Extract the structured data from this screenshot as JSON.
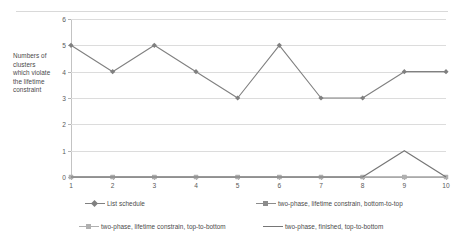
{
  "chart_data": {
    "type": "line",
    "title": "",
    "subtitle": "",
    "xlabel": "",
    "ylabel": "Numbers of clusters which violate the lifetime constraint",
    "ylabel_lines": [
      "Numbers of",
      "clusters",
      "which violate",
      "the lifetime",
      "constraint"
    ],
    "categories": [
      "1",
      "2",
      "3",
      "4",
      "5",
      "6",
      "7",
      "8",
      "9",
      "10"
    ],
    "x": [
      1,
      2,
      3,
      4,
      5,
      6,
      7,
      8,
      9,
      10
    ],
    "xlim": [
      1,
      10
    ],
    "ylim": [
      0,
      6
    ],
    "yticks": [
      "0",
      "1",
      "2",
      "3",
      "4",
      "5",
      "6"
    ],
    "ytick_values": [
      0,
      1,
      2,
      3,
      4,
      5,
      6
    ],
    "grid": true,
    "grid_axis": "y",
    "legend_position": "bottom",
    "series": [
      {
        "name": "List schedule",
        "values": [
          5,
          4,
          5,
          4,
          3,
          5,
          3,
          3,
          4,
          4
        ],
        "color": "#808080",
        "marker": "diamond"
      },
      {
        "name": "two-phase, lifetime constrain, bottom-to-top",
        "values": [
          0,
          0,
          0,
          0,
          0,
          0,
          0,
          0,
          0,
          0
        ],
        "color": "#8c8c8c",
        "marker": "square"
      },
      {
        "name": "two-phase, lifetime constrain, top-to-bottom",
        "values": [
          0,
          0,
          0,
          0,
          0,
          0,
          0,
          0,
          0,
          0
        ],
        "color": "#b0b0b0",
        "marker": "square"
      },
      {
        "name": "two-phase, finished, top-to-bottom",
        "values": [
          0,
          0,
          0,
          0,
          0,
          0,
          0,
          0,
          1,
          0
        ],
        "color": "#767676",
        "marker": "none"
      }
    ]
  },
  "legend": {
    "items": [
      {
        "label": "List schedule"
      },
      {
        "label": "two-phase, lifetime constrain, bottom-to-top"
      },
      {
        "label": "two-phase, lifetime constrain, top-to-bottom"
      },
      {
        "label": "two-phase, finished, top-to-bottom"
      }
    ]
  },
  "colors": {
    "gridline": "#dcdcdc",
    "axis": "#c3c3c3",
    "text": "#4a4a4a",
    "series1": "#808080",
    "series2": "#8c8c8c",
    "series3": "#b0b0b0",
    "series4": "#767676"
  }
}
